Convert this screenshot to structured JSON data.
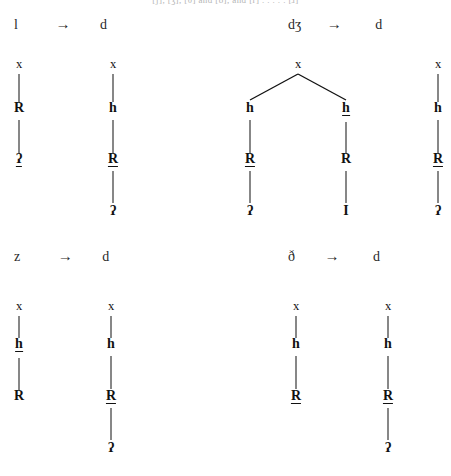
{
  "page": {
    "top_fragment": "[ʃ], [ʒ], [θ] and [ð], and [ɾ] . . . . . [ɹ]",
    "width": 451,
    "height": 476,
    "ink_color": "#111111",
    "background_color": "#ffffff"
  },
  "rules": [
    {
      "id": "rule-l-d",
      "source": "l",
      "arrow": "→",
      "target": "d",
      "x": 14,
      "y": 16
    },
    {
      "id": "rule-dz-d",
      "source": "dʒ",
      "arrow": "→",
      "target": "d",
      "x": 288,
      "y": 16
    },
    {
      "id": "rule-z-d",
      "source": "z",
      "arrow": "→",
      "target": "d",
      "x": 14,
      "y": 248
    },
    {
      "id": "rule-th-d",
      "source": "ð",
      "arrow": "→",
      "target": "d",
      "x": 288,
      "y": 248
    }
  ],
  "trees": [
    {
      "id": "tree-l-d-input",
      "type": "chain",
      "nodes": [
        {
          "label": "x",
          "bold": false,
          "underlined": false
        },
        {
          "label": "R",
          "bold": true,
          "underlined": false
        },
        {
          "label": "ʔ",
          "bold": true,
          "underlined": true
        }
      ]
    },
    {
      "id": "tree-l-d-output",
      "type": "chain",
      "nodes": [
        {
          "label": "x",
          "bold": false,
          "underlined": false
        },
        {
          "label": "h",
          "bold": true,
          "underlined": false
        },
        {
          "label": "R",
          "bold": true,
          "underlined": true
        },
        {
          "label": "ʔ",
          "bold": true,
          "underlined": false
        }
      ]
    },
    {
      "id": "tree-dz-d-input",
      "type": "branching",
      "root": {
        "label": "x",
        "bold": false,
        "underlined": false
      },
      "branches": [
        {
          "id": "branch-left",
          "nodes": [
            {
              "label": "h",
              "bold": true,
              "underlined": false
            },
            {
              "label": "R",
              "bold": true,
              "underlined": true
            },
            {
              "label": "ʔ",
              "bold": true,
              "underlined": false
            }
          ]
        },
        {
          "id": "branch-right",
          "nodes": [
            {
              "label": "h",
              "bold": true,
              "underlined": true
            },
            {
              "label": "R",
              "bold": true,
              "underlined": false
            },
            {
              "label": "I",
              "bold": true,
              "underlined": false
            }
          ]
        }
      ]
    },
    {
      "id": "tree-dz-d-output",
      "type": "chain",
      "nodes": [
        {
          "label": "x",
          "bold": false,
          "underlined": false
        },
        {
          "label": "h",
          "bold": true,
          "underlined": false
        },
        {
          "label": "R",
          "bold": true,
          "underlined": true
        },
        {
          "label": "ʔ",
          "bold": true,
          "underlined": false
        }
      ]
    },
    {
      "id": "tree-z-d-input",
      "type": "chain",
      "nodes": [
        {
          "label": "x",
          "bold": false,
          "underlined": false
        },
        {
          "label": "h",
          "bold": true,
          "underlined": true
        },
        {
          "label": "R",
          "bold": true,
          "underlined": false
        }
      ]
    },
    {
      "id": "tree-z-d-output",
      "type": "chain",
      "nodes": [
        {
          "label": "x",
          "bold": false,
          "underlined": false
        },
        {
          "label": "h",
          "bold": true,
          "underlined": false
        },
        {
          "label": "R",
          "bold": true,
          "underlined": true
        },
        {
          "label": "ʔ",
          "bold": true,
          "underlined": false
        }
      ]
    },
    {
      "id": "tree-th-d-input",
      "type": "chain",
      "nodes": [
        {
          "label": "x",
          "bold": false,
          "underlined": false
        },
        {
          "label": "h",
          "bold": true,
          "underlined": false
        },
        {
          "label": "R",
          "bold": true,
          "underlined": true
        }
      ]
    },
    {
      "id": "tree-th-d-output",
      "type": "chain",
      "nodes": [
        {
          "label": "x",
          "bold": false,
          "underlined": false
        },
        {
          "label": "h",
          "bold": true,
          "underlined": false
        },
        {
          "label": "R",
          "bold": true,
          "underlined": true
        },
        {
          "label": "ʔ",
          "bold": true,
          "underlined": false
        }
      ]
    }
  ]
}
